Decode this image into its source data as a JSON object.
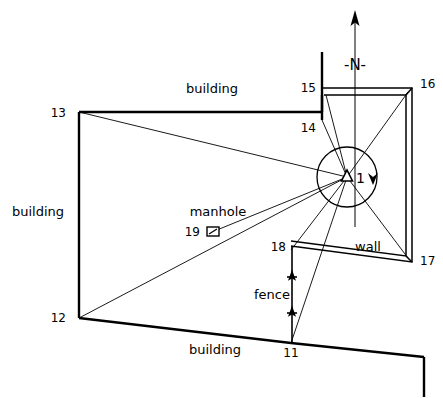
{
  "diagram": {
    "type": "surveying-site-plan",
    "ink_color": "#000000",
    "background_color": "#ffffff"
  },
  "north_arrow": {
    "label": "-N-",
    "name": "north-indicator"
  },
  "station": {
    "label": "1",
    "symbol": "triangle",
    "name": "survey-station-1",
    "rotation_direction": "clockwise"
  },
  "feature_labels": {
    "building_top": "building",
    "building_left": "building",
    "building_bottom": "building",
    "wall": "wall",
    "fence": "fence",
    "manhole": "manhole"
  },
  "points": [
    {
      "id": "11",
      "label": "11"
    },
    {
      "id": "12",
      "label": "12"
    },
    {
      "id": "13",
      "label": "13"
    },
    {
      "id": "14",
      "label": "14"
    },
    {
      "id": "15",
      "label": "15"
    },
    {
      "id": "16",
      "label": "16"
    },
    {
      "id": "17",
      "label": "17"
    },
    {
      "id": "18",
      "label": "18"
    },
    {
      "id": "19",
      "label": "19"
    }
  ]
}
